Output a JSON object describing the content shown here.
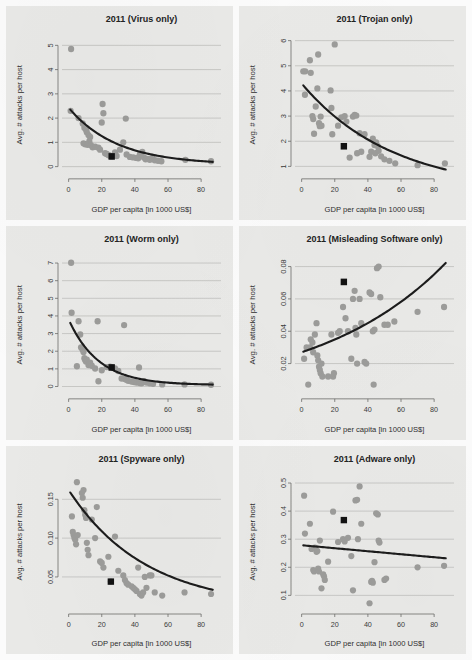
{
  "figure": {
    "columns": 2,
    "rows": 3,
    "point_color": "#9c9c9a",
    "line_color": "#1c1c1c",
    "marker_color": "#121212",
    "panel_bg": "#e9e9e7",
    "gridline_color": "#b9b9b7",
    "page_bg": "#fbfbfb"
  },
  "chart_data": [
    {
      "type": "scatter",
      "panel_index": 0,
      "title": "2011 (Virus only)",
      "xlabel": "GDP per capita [in 1000 US$]",
      "ylabel": "Avg. # attacks per host",
      "xlim": [
        -4,
        92
      ],
      "ylim": [
        -0.25,
        5.35
      ],
      "xticks": [
        0,
        20,
        40,
        60,
        80
      ],
      "yticks": [
        0,
        1,
        2,
        3,
        4,
        5
      ],
      "ytick_labels": [
        "0",
        "1",
        "2",
        "3",
        "4",
        "5"
      ],
      "grid": true,
      "legend": "none",
      "fit": {
        "kind": "exp",
        "a": 2.35,
        "b": 0.0345,
        "c": 0.08,
        "x0": 1,
        "x1": 87
      },
      "mean_marker": {
        "x": 26,
        "y": 0.42
      },
      "points": [
        [
          1.5,
          4.85
        ],
        [
          1.2,
          2.3
        ],
        [
          6.0,
          2.0
        ],
        [
          8.5,
          1.78
        ],
        [
          9.5,
          1.6
        ],
        [
          10.5,
          1.52
        ],
        [
          11.0,
          1.42
        ],
        [
          12.0,
          1.3
        ],
        [
          13.0,
          1.22
        ],
        [
          12.5,
          1.05
        ],
        [
          9.0,
          0.96
        ],
        [
          10.0,
          0.92
        ],
        [
          11.5,
          0.9
        ],
        [
          13.5,
          0.88
        ],
        [
          14.5,
          0.8
        ],
        [
          16.0,
          0.82
        ],
        [
          18.0,
          0.78
        ],
        [
          19.0,
          0.7
        ],
        [
          20.5,
          2.58
        ],
        [
          21.0,
          2.2
        ],
        [
          20.0,
          1.82
        ],
        [
          22.0,
          0.55
        ],
        [
          23.0,
          0.52
        ],
        [
          24.0,
          0.48
        ],
        [
          25.0,
          0.45
        ],
        [
          26.0,
          0.42
        ],
        [
          28.0,
          0.58
        ],
        [
          29.0,
          0.44
        ],
        [
          31.0,
          0.7
        ],
        [
          33.0,
          1.0
        ],
        [
          34.5,
          1.98
        ],
        [
          35.0,
          0.5
        ],
        [
          37.0,
          0.4
        ],
        [
          39.0,
          0.38
        ],
        [
          41.0,
          0.36
        ],
        [
          42.0,
          0.34
        ],
        [
          43.0,
          0.5
        ],
        [
          44.5,
          0.6
        ],
        [
          45.5,
          0.38
        ],
        [
          46.5,
          0.3
        ],
        [
          48.0,
          0.32
        ],
        [
          49.0,
          0.28
        ],
        [
          50.5,
          0.36
        ],
        [
          52.0,
          0.26
        ],
        [
          54.0,
          0.24
        ],
        [
          56.0,
          0.22
        ],
        [
          70.5,
          0.28
        ],
        [
          86.0,
          0.22
        ]
      ]
    },
    {
      "type": "scatter",
      "panel_index": 1,
      "title": "2011 (Trojan only)",
      "xlabel": "GDP per capita [in 1000 US$]",
      "ylabel": "Avg. # attacks per host",
      "xlim": [
        -4,
        92
      ],
      "ylim": [
        0.75,
        6.15
      ],
      "xticks": [
        0,
        20,
        40,
        60,
        80
      ],
      "yticks": [
        1,
        2,
        3,
        4,
        5,
        6
      ],
      "ytick_labels": [
        "1",
        "2",
        "3",
        "4",
        "5",
        "6"
      ],
      "grid": true,
      "legend": "none",
      "fit": {
        "kind": "exp",
        "a": 4.3,
        "b": 0.0183,
        "c": 0.0,
        "x0": 1,
        "x1": 87
      },
      "mean_marker": {
        "x": 25.5,
        "y": 1.8
      },
      "points": [
        [
          1.0,
          4.78
        ],
        [
          2.2,
          4.78
        ],
        [
          2.0,
          3.85
        ],
        [
          5.0,
          5.22
        ],
        [
          5.5,
          4.72
        ],
        [
          6.5,
          3.0
        ],
        [
          7.0,
          2.88
        ],
        [
          7.5,
          2.3
        ],
        [
          8.5,
          3.38
        ],
        [
          9.5,
          4.1
        ],
        [
          10.0,
          5.45
        ],
        [
          10.5,
          2.72
        ],
        [
          11.0,
          2.6
        ],
        [
          11.5,
          2.98
        ],
        [
          12.0,
          2.62
        ],
        [
          17.5,
          4.02
        ],
        [
          18.0,
          3.32
        ],
        [
          18.5,
          2.28
        ],
        [
          20.0,
          5.85
        ],
        [
          22.0,
          2.62
        ],
        [
          24.0,
          2.95
        ],
        [
          26.0,
          3.0
        ],
        [
          27.0,
          2.78
        ],
        [
          29.0,
          1.35
        ],
        [
          31.0,
          2.98
        ],
        [
          32.0,
          3.05
        ],
        [
          33.0,
          3.02
        ],
        [
          33.5,
          1.52
        ],
        [
          35.0,
          2.32
        ],
        [
          36.0,
          1.58
        ],
        [
          38.0,
          2.28
        ],
        [
          41.0,
          1.38
        ],
        [
          42.0,
          1.58
        ],
        [
          43.0,
          2.1
        ],
        [
          44.0,
          1.85
        ],
        [
          44.5,
          1.52
        ],
        [
          45.0,
          1.95
        ],
        [
          46.0,
          1.8
        ],
        [
          46.5,
          1.62
        ],
        [
          48.0,
          1.4
        ],
        [
          50.0,
          1.28
        ],
        [
          53.0,
          1.22
        ],
        [
          56.5,
          1.12
        ],
        [
          70.0,
          1.05
        ],
        [
          86.5,
          1.12
        ]
      ]
    },
    {
      "type": "scatter",
      "panel_index": 2,
      "title": "2011 (Worm only)",
      "xlabel": "GDP per capita [in 1000 US$]",
      "ylabel": "Avg. # attacks per host",
      "xlim": [
        -4,
        92
      ],
      "ylim": [
        -0.35,
        7.35
      ],
      "xticks": [
        0,
        20,
        40,
        60,
        80
      ],
      "yticks": [
        0,
        1,
        2,
        3,
        4,
        5,
        6,
        7
      ],
      "ytick_labels": [
        "0",
        "1",
        "2",
        "3",
        "4",
        "5",
        "6",
        "7"
      ],
      "grid": true,
      "legend": "none",
      "fit": {
        "kind": "exp",
        "a": 3.72,
        "b": 0.055,
        "c": 0.08,
        "x0": 1,
        "x1": 87
      },
      "mean_marker": {
        "x": 26.0,
        "y": 1.08
      },
      "points": [
        [
          1.5,
          7.02
        ],
        [
          1.8,
          4.18
        ],
        [
          6.0,
          3.7
        ],
        [
          7.0,
          2.95
        ],
        [
          7.5,
          2.22
        ],
        [
          8.0,
          2.18
        ],
        [
          8.5,
          2.08
        ],
        [
          9.0,
          1.95
        ],
        [
          5.0,
          1.15
        ],
        [
          9.5,
          1.6
        ],
        [
          10.0,
          1.5
        ],
        [
          10.5,
          1.42
        ],
        [
          11.0,
          1.52
        ],
        [
          12.0,
          1.22
        ],
        [
          13.0,
          1.35
        ],
        [
          14.0,
          1.18
        ],
        [
          16.0,
          1.02
        ],
        [
          17.5,
          3.7
        ],
        [
          18.0,
          0.3
        ],
        [
          20.0,
          0.92
        ],
        [
          23.0,
          1.1
        ],
        [
          25.0,
          1.12
        ],
        [
          26.0,
          1.08
        ],
        [
          28.0,
          1.02
        ],
        [
          30.0,
          0.88
        ],
        [
          32.0,
          0.45
        ],
        [
          33.5,
          3.48
        ],
        [
          34.0,
          0.42
        ],
        [
          35.0,
          0.38
        ],
        [
          36.0,
          0.32
        ],
        [
          38.0,
          0.28
        ],
        [
          39.5,
          0.25
        ],
        [
          41.0,
          0.22
        ],
        [
          42.5,
          1.08
        ],
        [
          43.0,
          0.2
        ],
        [
          44.0,
          0.18
        ],
        [
          45.5,
          0.3
        ],
        [
          47.0,
          0.22
        ],
        [
          49.0,
          0.18
        ],
        [
          51.0,
          0.15
        ],
        [
          56.5,
          0.12
        ],
        [
          70.0,
          0.12
        ],
        [
          86.0,
          0.1
        ]
      ]
    },
    {
      "type": "scatter",
      "panel_index": 3,
      "title": "2011 (Misleading Software only)",
      "xlabel": "GDP per capita [in 1000 US$]",
      "ylabel": "Avg. # attacks per host",
      "xlim": [
        -4,
        92
      ],
      "ylim": [
        0.002,
        0.086
      ],
      "xticks": [
        0,
        20,
        40,
        60,
        80
      ],
      "yticks": [
        0.02,
        0.04,
        0.06,
        0.08
      ],
      "ytick_labels": [
        "0.02",
        "0.04",
        "0.06",
        "0.08"
      ],
      "grid": true,
      "legend": "none",
      "fit": {
        "kind": "expgrow",
        "a": 0.027,
        "b": 0.0128,
        "x0": 1,
        "x1": 87
      },
      "mean_marker": {
        "x": 25.5,
        "y": 0.0705
      },
      "points": [
        [
          1.5,
          0.023
        ],
        [
          3.0,
          0.03
        ],
        [
          4.0,
          0.007
        ],
        [
          5.0,
          0.03
        ],
        [
          5.5,
          0.035
        ],
        [
          6.5,
          0.033
        ],
        [
          7.0,
          0.027
        ],
        [
          8.0,
          0.038
        ],
        [
          9.0,
          0.045
        ],
        [
          9.5,
          0.025
        ],
        [
          10.0,
          0.022
        ],
        [
          10.5,
          0.018
        ],
        [
          11.0,
          0.016
        ],
        [
          11.5,
          0.014
        ],
        [
          12.0,
          0.02
        ],
        [
          12.5,
          0.012
        ],
        [
          16.0,
          0.012
        ],
        [
          18.0,
          0.038
        ],
        [
          19.0,
          0.012
        ],
        [
          19.5,
          0.014
        ],
        [
          22.0,
          0.039
        ],
        [
          23.0,
          0.04
        ],
        [
          25.0,
          0.055
        ],
        [
          26.5,
          0.048
        ],
        [
          28.0,
          0.04
        ],
        [
          30.0,
          0.023
        ],
        [
          31.0,
          0.06
        ],
        [
          32.0,
          0.065
        ],
        [
          32.5,
          0.042
        ],
        [
          33.0,
          0.038
        ],
        [
          33.5,
          0.02
        ],
        [
          35.0,
          0.06
        ],
        [
          36.0,
          0.045
        ],
        [
          38.0,
          0.021
        ],
        [
          39.0,
          0.02
        ],
        [
          41.0,
          0.064
        ],
        [
          42.0,
          0.063
        ],
        [
          43.0,
          0.04
        ],
        [
          43.5,
          0.007
        ],
        [
          44.0,
          0.041
        ],
        [
          45.5,
          0.079
        ],
        [
          46.5,
          0.08
        ],
        [
          47.5,
          0.061
        ],
        [
          50.0,
          0.044
        ],
        [
          52.0,
          0.044
        ],
        [
          56.0,
          0.046
        ],
        [
          70.0,
          0.052
        ],
        [
          86.0,
          0.055
        ]
      ]
    },
    {
      "type": "scatter",
      "panel_index": 4,
      "title": "2011 (Spyware only)",
      "xlabel": "GDP per capita [in 1000 US$]",
      "ylabel": "Avg. # attacks per host",
      "xlim": [
        -4,
        92
      ],
      "ylim": [
        0.01,
        0.18
      ],
      "xticks": [
        0,
        20,
        40,
        60,
        80
      ],
      "yticks": [
        0.05,
        0.1,
        0.15
      ],
      "ytick_labels": [
        "0.05",
        "0.10",
        "0.15"
      ],
      "grid": true,
      "legend": "none",
      "fit": {
        "kind": "exp",
        "a": 0.152,
        "b": 0.0215,
        "c": 0.01,
        "x0": 1,
        "x1": 87
      },
      "mean_marker": {
        "x": 25.5,
        "y": 0.044
      },
      "points": [
        [
          2.0,
          0.128
        ],
        [
          2.5,
          0.108
        ],
        [
          3.0,
          0.104
        ],
        [
          3.5,
          0.1
        ],
        [
          4.0,
          0.098
        ],
        [
          4.5,
          0.092
        ],
        [
          5.0,
          0.172
        ],
        [
          5.5,
          0.104
        ],
        [
          8.0,
          0.158
        ],
        [
          8.5,
          0.152
        ],
        [
          9.0,
          0.162
        ],
        [
          9.5,
          0.136
        ],
        [
          10.0,
          0.13
        ],
        [
          10.5,
          0.126
        ],
        [
          11.0,
          0.094
        ],
        [
          11.5,
          0.085
        ],
        [
          12.0,
          0.078
        ],
        [
          14.0,
          0.124
        ],
        [
          16.0,
          0.1
        ],
        [
          17.0,
          0.14
        ],
        [
          19.0,
          0.07
        ],
        [
          20.0,
          0.068
        ],
        [
          21.0,
          0.062
        ],
        [
          24.0,
          0.076
        ],
        [
          25.5,
          0.044
        ],
        [
          28.0,
          0.102
        ],
        [
          30.0,
          0.058
        ],
        [
          33.0,
          0.052
        ],
        [
          34.0,
          0.046
        ],
        [
          35.0,
          0.042
        ],
        [
          36.0,
          0.04
        ],
        [
          38.0,
          0.038
        ],
        [
          39.0,
          0.036
        ],
        [
          40.0,
          0.034
        ],
        [
          41.0,
          0.032
        ],
        [
          42.0,
          0.062
        ],
        [
          43.0,
          0.028
        ],
        [
          44.0,
          0.026
        ],
        [
          45.0,
          0.03
        ],
        [
          46.0,
          0.05
        ],
        [
          47.0,
          0.036
        ],
        [
          49.0,
          0.052
        ],
        [
          50.0,
          0.052
        ],
        [
          52.0,
          0.03
        ],
        [
          56.5,
          0.026
        ],
        [
          70.0,
          0.03
        ],
        [
          86.0,
          0.028
        ]
      ]
    },
    {
      "type": "scatter",
      "panel_index": 5,
      "title": "2011 (Adware only)",
      "xlabel": "GDP per capita [in 1000 US$]",
      "ylabel": "Avg. # attacks per host",
      "xlim": [
        -4,
        92
      ],
      "ylim": [
        0.055,
        0.525
      ],
      "xticks": [
        0,
        20,
        40,
        60,
        80
      ],
      "yticks": [
        0.1,
        0.2,
        0.3,
        0.4,
        0.5
      ],
      "ytick_labels": [
        "0.1",
        "0.2",
        "0.3",
        "0.4",
        "0.5"
      ],
      "grid": true,
      "legend": "none",
      "fit": {
        "kind": "linear",
        "y0": 0.278,
        "y1": 0.232,
        "x0": 1,
        "x1": 87
      },
      "mean_marker": {
        "x": 25.5,
        "y": 0.368
      },
      "points": [
        [
          1.5,
          0.455
        ],
        [
          2.0,
          0.32
        ],
        [
          5.0,
          0.355
        ],
        [
          6.0,
          0.265
        ],
        [
          7.0,
          0.19
        ],
        [
          7.5,
          0.185
        ],
        [
          8.0,
          0.27
        ],
        [
          8.5,
          0.265
        ],
        [
          9.0,
          0.255
        ],
        [
          9.5,
          0.258
        ],
        [
          10.0,
          0.195
        ],
        [
          10.5,
          0.185
        ],
        [
          11.0,
          0.295
        ],
        [
          12.0,
          0.125
        ],
        [
          13.0,
          0.175
        ],
        [
          13.5,
          0.168
        ],
        [
          14.0,
          0.155
        ],
        [
          16.0,
          0.22
        ],
        [
          19.0,
          0.398
        ],
        [
          22.0,
          0.29
        ],
        [
          25.0,
          0.3
        ],
        [
          26.0,
          0.292
        ],
        [
          28.0,
          0.305
        ],
        [
          30.0,
          0.24
        ],
        [
          31.0,
          0.118
        ],
        [
          32.5,
          0.438
        ],
        [
          33.5,
          0.44
        ],
        [
          34.0,
          0.3
        ],
        [
          35.0,
          0.488
        ],
        [
          36.0,
          0.355
        ],
        [
          41.0,
          0.072
        ],
        [
          42.0,
          0.148
        ],
        [
          42.5,
          0.152
        ],
        [
          43.0,
          0.145
        ],
        [
          44.0,
          0.218
        ],
        [
          45.0,
          0.392
        ],
        [
          46.0,
          0.388
        ],
        [
          46.5,
          0.295
        ],
        [
          47.0,
          0.288
        ],
        [
          50.0,
          0.155
        ],
        [
          51.0,
          0.16
        ],
        [
          70.0,
          0.2
        ],
        [
          86.0,
          0.205
        ]
      ]
    }
  ]
}
